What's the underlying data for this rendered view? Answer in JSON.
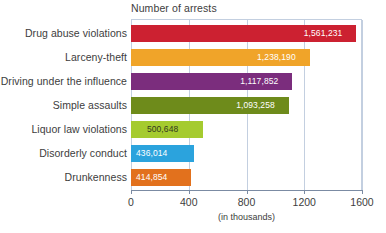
{
  "chart_data": {
    "type": "bar",
    "orientation": "horizontal",
    "title": "Number of arrests",
    "xlabel": "(in thousands)",
    "ylabel": "",
    "xlim": [
      0,
      1600
    ],
    "grid": true,
    "legend": "none",
    "xticks": [
      "0",
      "400",
      "800",
      "1200",
      "1600"
    ],
    "xtick_values": [
      0,
      400,
      800,
      1200,
      1600
    ],
    "categories": [
      "Drug abuse violations",
      "Larceny-theft",
      "Driving under the influence",
      "Simple assaults",
      "Liquor law violations",
      "Disorderly conduct",
      "Drunkenness"
    ],
    "values": [
      1561.231,
      1238.19,
      1117.852,
      1093.258,
      500.648,
      436.014,
      414.854
    ],
    "value_labels": [
      "1,561,231",
      "1,238,190",
      "1,117,852",
      "1,093,258",
      "500,648",
      "436,014",
      "414,854"
    ],
    "bar_colors": [
      "#cc2131",
      "#f0a429",
      "#7b2d7d",
      "#6e8b1b",
      "#a5cb2f",
      "#2ba3dd",
      "#e2711d"
    ],
    "label_text_colors": [
      "light",
      "light",
      "light",
      "light",
      "dark",
      "light",
      "light"
    ],
    "axis_color": "#7b8ba3",
    "grid_color": "#c3cfe0",
    "text_color": "#3d3d3d"
  }
}
